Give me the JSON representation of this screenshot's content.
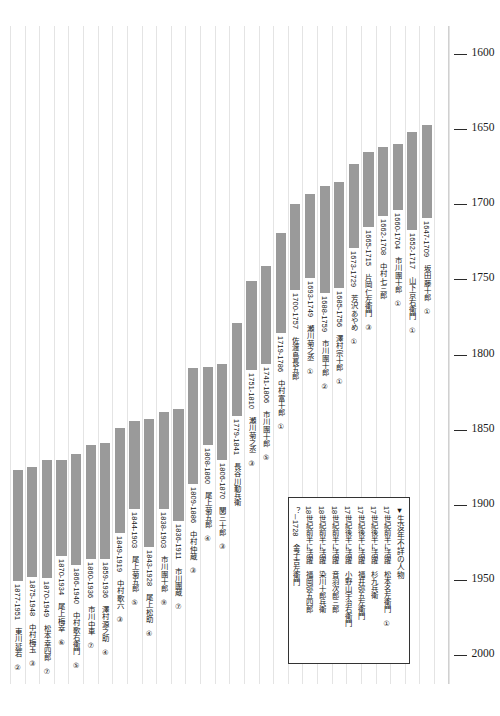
{
  "chart_data": {
    "type": "bar",
    "title": "",
    "subtitle": "",
    "xlabel": "",
    "ylabel": "",
    "orientation": "vertical-lifespan-range",
    "axis": {
      "reversed": true,
      "ylim": [
        1590,
        2010
      ],
      "ticks": [
        "1600",
        "1650",
        "1700",
        "1750",
        "1800",
        "1850",
        "1900",
        "1950",
        "2000"
      ],
      "tick_values": [
        1600,
        1650,
        1700,
        1750,
        1800,
        1850,
        1900,
        1950,
        2000
      ],
      "tick_side": "right",
      "grid": "vertical-only"
    },
    "legend": {
      "position": "bottom-right",
      "title": "▼生没年不詳の人物",
      "entries": [
        {
          "period": "17世紀前半に活躍",
          "name": "松本名左衛門",
          "mark": "①"
        },
        {
          "period": "17世紀後半に活躍",
          "name": "杉九兵衛",
          "mark": ""
        },
        {
          "period": "17世紀後半に活躍",
          "name": "福井弥五左衛門",
          "mark": ""
        },
        {
          "period": "17世紀後半に活躍",
          "name": "小野山宇治右衛門",
          "mark": ""
        },
        {
          "period": "18世紀前半に活躍",
          "name": "音羽次郎三郎",
          "mark": ""
        },
        {
          "period": "18世紀前半に活躍",
          "name": "染川十郎兵衛",
          "mark": ""
        },
        {
          "period": "18世紀前半に活躍",
          "name": "福岡弥五四郎",
          "mark": ""
        },
        {
          "period": "？－1728",
          "name": "金子吉左衛門",
          "mark": ""
        }
      ]
    },
    "bar_color": "#9a9a9a",
    "grid_color": "#e4e4e4",
    "categories": [
      "東川延若",
      "中村梅玉",
      "松本幸四郎",
      "尾上梅幸",
      "中村歌右衛門",
      "市川中車",
      "澤村源之助",
      "中村歌六",
      "尾上菊五郎",
      "尾上松助",
      "市川團十郎",
      "市川團蔵",
      "中村仲蔵",
      "尾上菊五郎",
      "関三十郎",
      "長谷川勤兵衛",
      "瀬川菊之丞",
      "市川團十郎",
      "中村富十郎",
      "佐渡島長五郎",
      "瀬川菊之丞",
      "市川團十郎",
      "澤村宗十郎",
      "芳沢あやめ",
      "片岡仁左衛門",
      "中村七三郎",
      "市川團十郎",
      "山下京右衛門",
      "坂田藤十郎"
    ],
    "bars": [
      {
        "label": "1877-1951",
        "name": "東川延若",
        "mark": "②",
        "start": 1877,
        "end": 1951
      },
      {
        "label": "1875-1948",
        "name": "中村梅玉",
        "mark": "③",
        "start": 1875,
        "end": 1948
      },
      {
        "label": "1870-1949",
        "name": "松本幸四郎",
        "mark": "⑦",
        "start": 1870,
        "end": 1949
      },
      {
        "label": "1870-1934",
        "name": "尾上梅幸",
        "mark": "⑥",
        "start": 1870,
        "end": 1934
      },
      {
        "label": "1866-1940",
        "name": "中村歌右衛門",
        "mark": "⑤",
        "start": 1866,
        "end": 1940
      },
      {
        "label": "1860-1936",
        "name": "市川中車",
        "mark": "⑦",
        "start": 1860,
        "end": 1936
      },
      {
        "label": "1859-1936",
        "name": "澤村源之助",
        "mark": "④",
        "start": 1859,
        "end": 1936
      },
      {
        "label": "1849-1919",
        "name": "中村歌六",
        "mark": "③",
        "start": 1849,
        "end": 1919
      },
      {
        "label": "1844-1903",
        "name": "尾上菊五郎",
        "mark": "⑤",
        "start": 1844,
        "end": 1903
      },
      {
        "label": "1843-1928",
        "name": "尾上松助",
        "mark": "④",
        "start": 1843,
        "end": 1928
      },
      {
        "label": "1838-1903",
        "name": "市川團十郎",
        "mark": "⑨",
        "start": 1838,
        "end": 1903
      },
      {
        "label": "1836-1911",
        "name": "市川團蔵",
        "mark": "⑦",
        "start": 1836,
        "end": 1911
      },
      {
        "label": "1809-1886",
        "name": "中村仲蔵",
        "mark": "③",
        "start": 1809,
        "end": 1886
      },
      {
        "label": "1808-1860",
        "name": "尾上菊五郎",
        "mark": "④",
        "start": 1808,
        "end": 1860
      },
      {
        "label": "1806-1870",
        "name": "関三十郎",
        "mark": "③",
        "start": 1806,
        "end": 1870
      },
      {
        "label": "1779-1841",
        "name": "長谷川勤兵衛",
        "mark": "",
        "start": 1779,
        "end": 1841
      },
      {
        "label": "1751-1810",
        "name": "瀬川菊之丞",
        "mark": "③",
        "start": 1751,
        "end": 1810
      },
      {
        "label": "1741-1806",
        "name": "市川團十郎",
        "mark": "⑤",
        "start": 1741,
        "end": 1806
      },
      {
        "label": "1719-1786",
        "name": "中村富十郎",
        "mark": "①",
        "start": 1719,
        "end": 1786
      },
      {
        "label": "1700-1757",
        "name": "佐渡島長五郎",
        "mark": "",
        "start": 1700,
        "end": 1757
      },
      {
        "label": "1693-1749",
        "name": "瀬川菊之丞",
        "mark": "①",
        "start": 1693,
        "end": 1749
      },
      {
        "label": "1688-1759",
        "name": "市川團十郎",
        "mark": "②",
        "start": 1688,
        "end": 1759
      },
      {
        "label": "1685-1756",
        "name": "澤村宗十郎",
        "mark": "①",
        "start": 1685,
        "end": 1756
      },
      {
        "label": "1673-1729",
        "name": "芳沢あやめ",
        "mark": "①",
        "start": 1673,
        "end": 1729
      },
      {
        "label": "1665-1715",
        "name": "片岡仁左衛門",
        "mark": "③",
        "start": 1665,
        "end": 1715
      },
      {
        "label": "1662-1708",
        "name": "中村七三郎",
        "mark": "",
        "start": 1662,
        "end": 1708
      },
      {
        "label": "1660-1704",
        "name": "市川團十郎",
        "mark": "①",
        "start": 1660,
        "end": 1704
      },
      {
        "label": "1652-1717",
        "name": "山下京右衛門",
        "mark": "①",
        "start": 1652,
        "end": 1717
      },
      {
        "label": "1647-1709",
        "name": "坂田藤十郎",
        "mark": "①",
        "start": 1647,
        "end": 1709
      }
    ]
  }
}
